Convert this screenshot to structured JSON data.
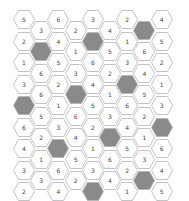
{
  "board": {
    "colors": {
      "cell_fill": "#ffffff",
      "cell_stroke": "#b4b4b4",
      "dark_fill": "#8a8a8a"
    },
    "cells": [
      {
        "col": 0,
        "row": 0,
        "value": "5"
      },
      {
        "col": 0,
        "row": 1,
        "value": "2"
      },
      {
        "col": 0,
        "row": 2,
        "value": "1"
      },
      {
        "col": 0,
        "row": 3,
        "value": "3"
      },
      {
        "col": 0,
        "row": 4,
        "value": "",
        "dark": true
      },
      {
        "col": 0,
        "row": 5,
        "value": "6"
      },
      {
        "col": 0,
        "row": 6,
        "value": "4"
      },
      {
        "col": 0,
        "row": 7,
        "value": "3"
      },
      {
        "col": 0,
        "row": 8,
        "value": "2"
      },
      {
        "col": 1,
        "row": 0,
        "value": "3"
      },
      {
        "col": 1,
        "row": 1,
        "value": "",
        "dark": true
      },
      {
        "col": 1,
        "row": 2,
        "value": "6"
      },
      {
        "col": 1,
        "row": 3,
        "value": "6"
      },
      {
        "col": 1,
        "row": 4,
        "value": "5"
      },
      {
        "col": 1,
        "row": 5,
        "value": "2"
      },
      {
        "col": 1,
        "row": 6,
        "value": "1"
      },
      {
        "col": 1,
        "row": 7,
        "value": "3"
      },
      {
        "col": 2,
        "row": 0,
        "value": "6"
      },
      {
        "col": 2,
        "row": 1,
        "value": "4"
      },
      {
        "col": 2,
        "row": 2,
        "value": "5"
      },
      {
        "col": 2,
        "row": 3,
        "value": "2"
      },
      {
        "col": 2,
        "row": 4,
        "value": "1"
      },
      {
        "col": 2,
        "row": 5,
        "value": "3"
      },
      {
        "col": 2,
        "row": 6,
        "value": "",
        "dark": true
      },
      {
        "col": 2,
        "row": 7,
        "value": "6"
      },
      {
        "col": 2,
        "row": 8,
        "value": "4"
      },
      {
        "col": 3,
        "row": 0,
        "value": "2"
      },
      {
        "col": 3,
        "row": 1,
        "value": "1"
      },
      {
        "col": 3,
        "row": 2,
        "value": "3"
      },
      {
        "col": 3,
        "row": 3,
        "value": "",
        "dark": true
      },
      {
        "col": 3,
        "row": 4,
        "value": "6"
      },
      {
        "col": 3,
        "row": 5,
        "value": "4"
      },
      {
        "col": 3,
        "row": 6,
        "value": "5"
      },
      {
        "col": 3,
        "row": 7,
        "value": "2"
      },
      {
        "col": 4,
        "row": 0,
        "value": "3"
      },
      {
        "col": 4,
        "row": 1,
        "value": "",
        "dark": true
      },
      {
        "col": 4,
        "row": 2,
        "value": "6"
      },
      {
        "col": 4,
        "row": 3,
        "value": "4"
      },
      {
        "col": 4,
        "row": 4,
        "value": "5"
      },
      {
        "col": 4,
        "row": 5,
        "value": "2"
      },
      {
        "col": 4,
        "row": 6,
        "value": "1"
      },
      {
        "col": 4,
        "row": 7,
        "value": "3"
      },
      {
        "col": 4,
        "row": 8,
        "value": "",
        "dark": true
      },
      {
        "col": 5,
        "row": 0,
        "value": "4"
      },
      {
        "col": 5,
        "row": 1,
        "value": "5"
      },
      {
        "col": 5,
        "row": 2,
        "value": "2"
      },
      {
        "col": 5,
        "row": 3,
        "value": "1"
      },
      {
        "col": 5,
        "row": 4,
        "value": "3"
      },
      {
        "col": 5,
        "row": 5,
        "value": "",
        "dark": true
      },
      {
        "col": 5,
        "row": 6,
        "value": "6"
      },
      {
        "col": 5,
        "row": 7,
        "value": "4"
      },
      {
        "col": 6,
        "row": 0,
        "value": "2"
      },
      {
        "col": 6,
        "row": 1,
        "value": "1"
      },
      {
        "col": 6,
        "row": 2,
        "value": "3"
      },
      {
        "col": 6,
        "row": 3,
        "value": "",
        "dark": true
      },
      {
        "col": 6,
        "row": 4,
        "value": "6"
      },
      {
        "col": 6,
        "row": 5,
        "value": "4"
      },
      {
        "col": 6,
        "row": 6,
        "value": "5"
      },
      {
        "col": 6,
        "row": 7,
        "value": "2"
      },
      {
        "col": 6,
        "row": 8,
        "value": "1"
      },
      {
        "col": 7,
        "row": 0,
        "value": "",
        "dark": true
      },
      {
        "col": 7,
        "row": 1,
        "value": "6"
      },
      {
        "col": 7,
        "row": 2,
        "value": "4"
      },
      {
        "col": 7,
        "row": 3,
        "value": "5"
      },
      {
        "col": 7,
        "row": 4,
        "value": "2"
      },
      {
        "col": 7,
        "row": 5,
        "value": "1"
      },
      {
        "col": 7,
        "row": 6,
        "value": "3"
      },
      {
        "col": 7,
        "row": 7,
        "value": "",
        "dark": true
      },
      {
        "col": 8,
        "row": 0,
        "value": "4"
      },
      {
        "col": 8,
        "row": 1,
        "value": "5"
      },
      {
        "col": 8,
        "row": 2,
        "value": "2"
      },
      {
        "col": 8,
        "row": 3,
        "value": "1"
      },
      {
        "col": 8,
        "row": 4,
        "value": "3"
      },
      {
        "col": 8,
        "row": 5,
        "value": "",
        "dark": true
      },
      {
        "col": 8,
        "row": 6,
        "value": "6"
      },
      {
        "col": 8,
        "row": 7,
        "value": "4"
      },
      {
        "col": 8,
        "row": 8,
        "value": "5"
      }
    ]
  }
}
